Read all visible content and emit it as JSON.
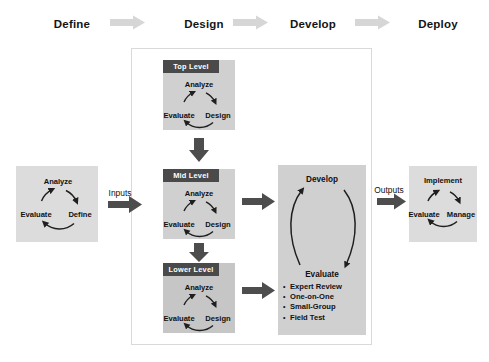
{
  "header": {
    "phases": [
      {
        "label": "Define"
      },
      {
        "label": "Design"
      },
      {
        "label": "Develop"
      },
      {
        "label": "Deploy"
      }
    ],
    "arrow_icon": "right-block-arrow-icon"
  },
  "left_panel": {
    "cycle": {
      "top": "Analyze",
      "right": "Define",
      "left": "Evaluate"
    }
  },
  "connectors": {
    "inputs_label": "Inputs",
    "outputs_label": "Outputs",
    "inputs_arrow_icon": "right-arrow-icon",
    "outputs_arrow_icon": "right-arrow-icon",
    "down_arrow_icon": "down-arrow-icon",
    "mid_to_develop_arrow_icon": "right-arrow-icon",
    "lower_to_list_arrow_icon": "right-arrow-icon"
  },
  "levels": [
    {
      "tag": "Top Level",
      "cycle": {
        "top": "Analyze",
        "right": "Design",
        "left": "Evaluate"
      }
    },
    {
      "tag": "Mid Level",
      "cycle": {
        "top": "Analyze",
        "right": "Design",
        "left": "Evaluate"
      }
    },
    {
      "tag": "Lower Level",
      "cycle": {
        "top": "Analyze",
        "right": "Design",
        "left": "Evaluate"
      }
    }
  ],
  "develop_panel": {
    "cycle": {
      "top": "Develop",
      "bottom": "Evaluate"
    },
    "bullets": [
      "Expert Review",
      "One-on-One",
      "Small-Group",
      "Field Test"
    ],
    "bullet_marker": "•"
  },
  "right_panel": {
    "cycle": {
      "top": "Implement",
      "right": "Manage",
      "left": "Evaluate"
    }
  },
  "colors": {
    "panel_gray": "#d2d2d2",
    "panel_light": "#dcdcdc",
    "panel_dark": "#c6c6c6",
    "tag_dark": "#4a4a4a",
    "arrow_dark": "#4d4d4d",
    "arrow_light": "#d4d4d4",
    "border": "#d9d9d9",
    "text": "#141414"
  }
}
